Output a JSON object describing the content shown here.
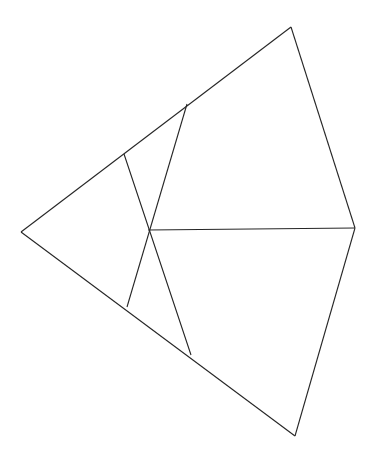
{
  "document": {
    "type": "geometric-line-diagram",
    "title": "Quadrilateral with internal crossing segments",
    "background_color": "#ffffff",
    "canvas": {
      "width": 376,
      "height": 454
    }
  },
  "style": {
    "stroke_color": "#262626",
    "stroke_width": 1.1,
    "fill": "none"
  },
  "chart_data": {
    "type": "diagram",
    "xlabel": "",
    "ylabel": "",
    "xlim": [
      0,
      376
    ],
    "ylim": [
      0,
      454
    ],
    "grid": false,
    "legend": "none",
    "points": [
      {
        "id": "L",
        "name": "left-vertex",
        "x": 21,
        "y": 232
      },
      {
        "id": "T",
        "name": "top-vertex",
        "x": 291,
        "y": 27
      },
      {
        "id": "R",
        "name": "right-vertex",
        "x": 355,
        "y": 228
      },
      {
        "id": "B",
        "name": "bottom-vertex",
        "x": 295,
        "y": 436
      },
      {
        "id": "C",
        "name": "center-crossing",
        "x": 148,
        "y": 230
      },
      {
        "id": "U1",
        "name": "upper-edge-node-near",
        "x": 124,
        "y": 154
      },
      {
        "id": "U2",
        "name": "upper-edge-node-far",
        "x": 187,
        "y": 104
      },
      {
        "id": "D1",
        "name": "lower-edge-node-near",
        "x": 127,
        "y": 307
      },
      {
        "id": "D2",
        "name": "lower-edge-node-far",
        "x": 191,
        "y": 355
      }
    ],
    "segments": [
      {
        "id": "seg-upper-left-edge",
        "name": "upper-left-edge",
        "from": "L",
        "to": "T",
        "path": "21,232 291,27"
      },
      {
        "id": "seg-upper-right-edge",
        "name": "upper-right-edge",
        "from": "T",
        "to": "R",
        "path": "291,27 355,228"
      },
      {
        "id": "seg-lower-right-edge",
        "name": "lower-right-edge",
        "from": "R",
        "to": "B",
        "path": "355,228 295,436"
      },
      {
        "id": "seg-lower-left-edge",
        "name": "lower-left-edge",
        "from": "B",
        "to": "L",
        "path": "295,436 21,232"
      },
      {
        "id": "seg-horizontal-median",
        "name": "horizontal-median",
        "from": "C",
        "to": "R",
        "path": "148,230 355,228"
      },
      {
        "id": "seg-diagonal-down-right",
        "name": "diagonal-upper-left-to-lower-right",
        "from": "U1",
        "to": "D2",
        "path": "124,154 191,355"
      },
      {
        "id": "seg-diagonal-down-left",
        "name": "diagonal-upper-right-to-lower-left",
        "from": "U2",
        "to": "D1",
        "path": "187,104 127,307"
      }
    ],
    "regions": [
      {
        "id": "region-left-triangle",
        "name": "left-triangle",
        "polygon": "21,232 124,154 148,230 127,307"
      },
      {
        "id": "region-upper-narrow-triangle",
        "name": "upper-narrow-triangle",
        "polygon": "124,154 187,104 148,230"
      },
      {
        "id": "region-upper-right-quad",
        "name": "upper-right-quad",
        "polygon": "187,104 291,27 355,228 148,230"
      },
      {
        "id": "region-lower-narrow-triangle",
        "name": "lower-narrow-triangle",
        "polygon": "148,230 191,355 127,307"
      },
      {
        "id": "region-lower-right-quad",
        "name": "lower-right-quad",
        "polygon": "148,230 355,228 295,436 191,355"
      }
    ]
  }
}
